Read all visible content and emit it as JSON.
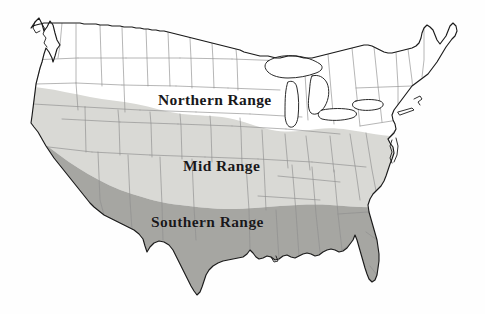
{
  "map": {
    "title": "United States Range Map",
    "subject": "plant hardiness / species range bands",
    "background_color": "#fefefe",
    "outline_color": "#1a1a1a",
    "state_border_color": "#8c8c8c",
    "lake_fill_color": "#ffffff",
    "projection_note": "contiguous United States, 48 states",
    "bands": [
      {
        "id": "northern",
        "label": "Northern Range",
        "fill": "#ffffff",
        "description": "northernmost band, unshaded white",
        "label_x": 158,
        "label_y": 91
      },
      {
        "id": "mid",
        "label": "Mid Range",
        "fill": "#d9d9d5",
        "description": "central band, light gray shading",
        "label_x": 183,
        "label_y": 157
      },
      {
        "id": "southern",
        "label": "Southern Range",
        "fill": "#a6a6a2",
        "description": "southernmost band, medium gray shading",
        "label_x": 151,
        "label_y": 213
      }
    ],
    "legend_present": false,
    "graticule_present": false
  }
}
